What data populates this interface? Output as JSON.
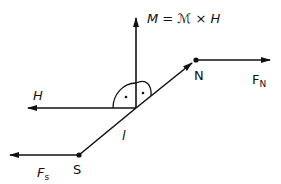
{
  "diagram": {
    "title_equation": "M = ℳ × H",
    "labels": {
      "moment": "M = ℳ × H",
      "field": "H",
      "north_pole": "N",
      "south_pole": "S",
      "force_north": "F",
      "force_north_sub": "N",
      "force_south": "F",
      "force_south_sub": "s",
      "length": "l"
    },
    "colors": {
      "stroke": "#111111",
      "background": "#ffffff"
    }
  }
}
